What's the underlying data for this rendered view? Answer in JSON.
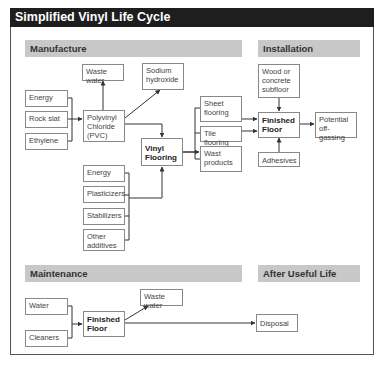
{
  "title": "Simplified Vinyl Life Cycle",
  "sections": {
    "manufacture": "Manufacture",
    "installation": "Installation",
    "maintenance": "Maintenance",
    "after_useful_life": "After Useful Life"
  },
  "manufacture": {
    "inputs": [
      "Energy",
      "Rock slat",
      "Ethylene"
    ],
    "pvc": "Polyvinyl Chloride (PVC)",
    "waste_water": "Waste water",
    "sodium_hydroxide": "Sodium hydroxide",
    "vinyl_flooring": "Vinyl Flooring",
    "additives": [
      "Energy",
      "Plasticizers",
      "Stabilizers",
      "Other additives"
    ],
    "outputs": [
      "Sheet flooring",
      "Tile flooring",
      "Wast products"
    ]
  },
  "installation": {
    "subfloor": "Wood or concrete subfloor",
    "finished_floor": "Finished Floor",
    "off_gassing": "Potential off-gassing",
    "adhesives": "Adhesives"
  },
  "maintenance": {
    "inputs": [
      "Water",
      "Cleaners"
    ],
    "finished_floor": "Finished Floor",
    "waste_water": "Waste water"
  },
  "after_useful_life": {
    "disposal": "Disposal"
  },
  "colors": {
    "title_bg": "#1e1e1e",
    "section_bg": "#c8c8c8",
    "line": "#333333",
    "box_border": "#888888"
  }
}
